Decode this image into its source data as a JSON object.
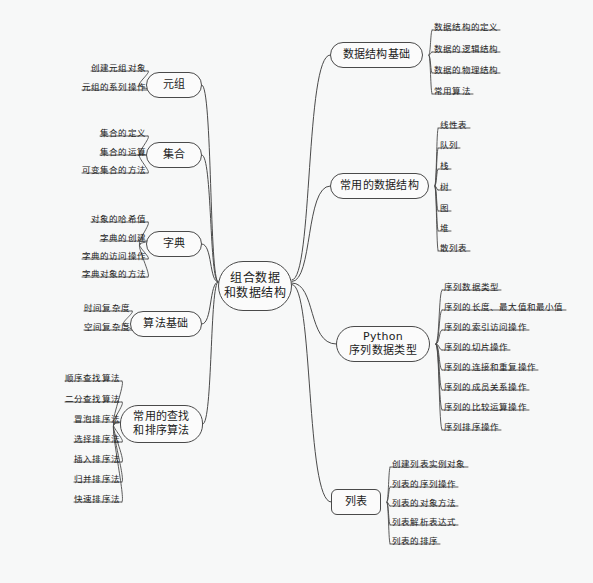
{
  "document": {
    "type": "mind-map",
    "title": "组合数据和数据结构",
    "background_color": "#f7f8f8",
    "line_color": "#4a4a4a",
    "text_color": "#1b1b1b"
  },
  "root": {
    "label_line1": "组合数据",
    "label_line2": "和数据结构"
  },
  "branches": [
    {
      "id": "shuju-jiegou-jichu",
      "label": "数据结构基础",
      "side": "right",
      "leaves": [
        "数据结构的定义",
        "数据的逻辑结构",
        "数据的物理结构",
        "常用算法"
      ]
    },
    {
      "id": "changyong-shuju-jiegou",
      "label": "常用的数据结构",
      "side": "right",
      "leaves": [
        "线性表",
        "队列",
        "栈",
        "树",
        "图",
        "堆",
        "散列表"
      ]
    },
    {
      "id": "python-xulie",
      "label_line1": "Python",
      "label_line2": "序列数据类型",
      "label": "Python 序列数据类型",
      "side": "right",
      "leaves": [
        "序列数据类型",
        "序列的长度、最大值和最小值",
        "序列的索引访问操作",
        "序列的切片操作",
        "序列的连接和重复操作",
        "序列的成员关系操作",
        "序列的比较运算操作",
        "序列排序操作"
      ]
    },
    {
      "id": "liebiao",
      "label": "列表",
      "side": "right",
      "leaves": [
        "创建列表实例对象",
        "列表的序列操作",
        "列表的对象方法",
        "列表解析表达式",
        "列表的排序"
      ]
    },
    {
      "id": "yuanzu",
      "label": "元组",
      "side": "left",
      "leaves": [
        "创建元组对象",
        "元组的系列操作"
      ]
    },
    {
      "id": "jihe",
      "label": "集合",
      "side": "left",
      "leaves": [
        "集合的定义",
        "集合的运算",
        "可变集合的方法"
      ]
    },
    {
      "id": "zidian",
      "label": "字典",
      "side": "left",
      "leaves": [
        "对象的哈希值",
        "字典的创建",
        "字典的访问操作",
        "字典对象的方法"
      ]
    },
    {
      "id": "suanfa-jichu",
      "label": "算法基础",
      "side": "left",
      "leaves": [
        "时间复杂度",
        "空间复杂度"
      ]
    },
    {
      "id": "chazhao-paixu",
      "label_line1": "常用的查找",
      "label_line2": "和排序算法",
      "label": "常用的查找和排序算法",
      "side": "left",
      "leaves": [
        "顺序查找算法",
        "二分查找算法",
        "冒泡排序法",
        "选择排序法",
        "插入排序法",
        "归并排序法",
        "快速排序法"
      ]
    }
  ],
  "layout": {
    "root": {
      "x": 218,
      "y": 261,
      "w": 74,
      "h": 50
    },
    "nodes": {
      "shuju-jiegou-jichu": {
        "x": 330,
        "y": 42,
        "w": 93,
        "h": 26
      },
      "changyong-shuju-jiegou": {
        "x": 330,
        "y": 173,
        "w": 99,
        "h": 26
      },
      "python-xulie": {
        "x": 336,
        "y": 326,
        "w": 94,
        "h": 36
      },
      "liebiao": {
        "x": 331,
        "y": 489,
        "w": 50,
        "h": 26
      },
      "yuanzu": {
        "x": 146,
        "y": 72,
        "w": 56,
        "h": 26
      },
      "jihe": {
        "x": 146,
        "y": 142,
        "w": 56,
        "h": 26
      },
      "zidian": {
        "x": 146,
        "y": 231,
        "w": 56,
        "h": 26
      },
      "suanfa-jichu": {
        "x": 130,
        "y": 311,
        "w": 72,
        "h": 26
      },
      "chazhao-paixu": {
        "x": 120,
        "y": 405,
        "w": 83,
        "h": 38
      }
    },
    "leaves": {
      "shuju-jiegou-jichu": {
        "x": 434,
        "ys": [
          30,
          52,
          73,
          94
        ]
      },
      "changyong-shuju-jiegou": {
        "x": 440,
        "ys": [
          128,
          148,
          169,
          190,
          211,
          231,
          251
        ]
      },
      "python-xulie": {
        "x": 444,
        "ys": [
          290,
          310,
          330,
          350,
          370,
          390,
          410,
          430
        ]
      },
      "liebiao": {
        "x": 392,
        "ys": [
          467,
          487,
          506,
          525,
          544
        ]
      },
      "yuanzu": {
        "x": 146,
        "ys": [
          71,
          90
        ]
      },
      "jihe": {
        "x": 146,
        "ys": [
          136,
          155,
          173
        ]
      },
      "zidian": {
        "x": 146,
        "ys": [
          222,
          241,
          259,
          277
        ]
      },
      "suanfa-jichu": {
        "x": 130,
        "ys": [
          311,
          330
        ]
      },
      "chazhao-paixu": {
        "x": 120,
        "ys": [
          381,
          402,
          422,
          442,
          462,
          482,
          502
        ]
      }
    }
  }
}
